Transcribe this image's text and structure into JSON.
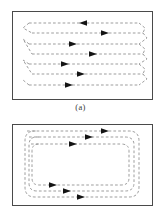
{
  "figure": {
    "type": "diagram",
    "background_color": "#ffffff",
    "panels": [
      {
        "id": "a",
        "caption": "(a)",
        "pattern_name": "boustrophedon-serpentine-path",
        "frame": {
          "x": 12,
          "y": 11,
          "width": 141,
          "height": 89,
          "border_color": "#4a4a4a",
          "border_width": 1.3
        },
        "line_style": {
          "color": "#8d8d8d",
          "width": 0.85,
          "dash": "2.7 2.1"
        },
        "arrow_color": "#141414",
        "rows": [
          {
            "index": 0,
            "y": 11,
            "x_start": 16,
            "x_end": 126,
            "direction": "left",
            "arrow_x": 72
          },
          {
            "index": 1,
            "y": 21,
            "x_start": 19,
            "x_end": 130,
            "direction": "right",
            "arrow_x": 90
          },
          {
            "index": 2,
            "y": 32,
            "x_start": 16,
            "x_end": 126,
            "direction": "right",
            "arrow_x": 58
          },
          {
            "index": 3,
            "y": 42,
            "x_start": 19,
            "x_end": 130,
            "direction": "right",
            "arrow_x": 78
          },
          {
            "index": 4,
            "y": 52,
            "x_start": 16,
            "x_end": 126,
            "direction": "right",
            "arrow_x": 50
          },
          {
            "index": 5,
            "y": 62,
            "x_start": 19,
            "x_end": 130,
            "direction": "right",
            "arrow_x": 66
          },
          {
            "index": 6,
            "y": 73,
            "x_start": 16,
            "x_end": 126,
            "direction": "right",
            "arrow_x": 54
          }
        ],
        "turn_style": "slanted-chevron"
      },
      {
        "id": "b",
        "caption": "",
        "pattern_name": "spiral-nested-rounded-rectangle-path",
        "frame": {
          "x": 12,
          "y": 124,
          "width": 141,
          "height": 82,
          "border_color": "#4a4a4a",
          "border_width": 1.3
        },
        "line_style": {
          "color": "#8d8d8d",
          "width": 0.85,
          "dash": "2.7 2.1"
        },
        "arrow_color": "#141414",
        "loops": [
          {
            "index": 0,
            "inset": 4,
            "corner_radius": 10,
            "arrow_direction": "right",
            "arrow_top_x": 98,
            "arrow_bottom_x": 74
          },
          {
            "index": 1,
            "inset": 9,
            "corner_radius": 9,
            "arrow_direction": "right",
            "arrow_top_x": 82,
            "arrow_bottom_x": 60
          },
          {
            "index": 2,
            "inset": 14,
            "corner_radius": 8,
            "arrow_direction": "right",
            "arrow_top_x": 66,
            "arrow_bottom_x": 46
          }
        ],
        "turn_style": "rounded-corner"
      }
    ]
  }
}
